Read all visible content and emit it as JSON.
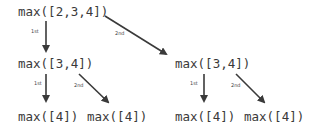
{
  "diagram": {
    "nodes": {
      "root": "max([2,3,4])",
      "l1_left": "max([3,4])",
      "l1_right": "max([3,4])",
      "l2_ll": "max([4])",
      "l2_lr": "max([4])",
      "l2_rl": "max([4])",
      "l2_rr": "max([4])"
    },
    "edge_labels": {
      "first": "1st",
      "second": "2nd"
    },
    "colors": {
      "text": "#3a3a3a",
      "arrow": "#3a3a3a"
    }
  }
}
